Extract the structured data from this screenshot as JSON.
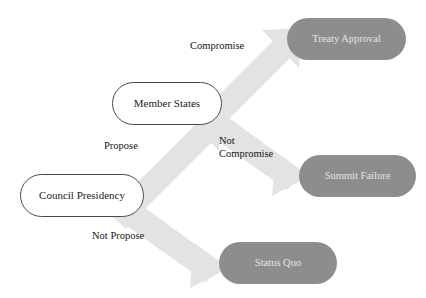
{
  "diagram": {
    "type": "decision-tree",
    "title": "",
    "background_color": "#ffffff",
    "arrow_color": "#e3e3e3",
    "terminal_fill": "#8d8d8d",
    "terminal_text_color": "#e4e4e4",
    "decision_border_color": "#4a4a4a",
    "decision_text_color": "#1a1a1a",
    "nodes": [
      {
        "id": "council-presidency",
        "label": "Council Presidency",
        "kind": "decision",
        "x": 20,
        "y": 174,
        "w": 124,
        "h": 43
      },
      {
        "id": "member-states",
        "label": "Member States",
        "kind": "decision",
        "x": 112,
        "y": 82,
        "w": 110,
        "h": 43
      },
      {
        "id": "treaty-approval",
        "label": "Treaty Approval",
        "kind": "terminal",
        "x": 287,
        "y": 18,
        "w": 119,
        "h": 42
      },
      {
        "id": "summit-failure",
        "label": "Summit  Failure",
        "kind": "terminal",
        "x": 299,
        "y": 155,
        "w": 117,
        "h": 42
      },
      {
        "id": "status-quo",
        "label": "Status Quo",
        "kind": "terminal",
        "x": 219,
        "y": 242,
        "w": 118,
        "h": 42
      }
    ],
    "edges": [
      {
        "id": "propose",
        "from": "council-presidency",
        "to": "member-states",
        "label": "Propose",
        "label_x": 104,
        "label_y": 139,
        "align": "center"
      },
      {
        "id": "not-propose",
        "from": "council-presidency",
        "to": "status-quo",
        "label": "Not Propose",
        "label_x": 92,
        "label_y": 229,
        "align": "center"
      },
      {
        "id": "compromise",
        "from": "member-states",
        "to": "treaty-approval",
        "label": "Compromise",
        "label_x": 190,
        "label_y": 39,
        "align": "center"
      },
      {
        "id": "not-compromise",
        "from": "member-states",
        "to": "summit-failure",
        "label": "Not\nCompromise",
        "label_x": 219,
        "label_y": 134,
        "align": "left"
      }
    ]
  }
}
